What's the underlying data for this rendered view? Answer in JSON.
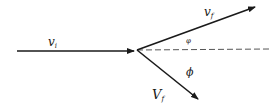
{
  "diagram": {
    "type": "velocity-collision-vectors",
    "colors": {
      "stroke": "#1a1a1a",
      "dashed": "#555555",
      "background": "#ffffff"
    },
    "vectors": [
      {
        "id": "incoming",
        "label": "v",
        "subscript": "i"
      },
      {
        "id": "scattered",
        "label": "v",
        "subscript": "f"
      },
      {
        "id": "recoil",
        "label": "V",
        "subscript": "f"
      }
    ],
    "angles": [
      {
        "id": "upper-angle",
        "label": "φ"
      },
      {
        "id": "lower-angle",
        "label": "ϕ"
      }
    ],
    "reference_line": "dashed horizontal axis"
  }
}
